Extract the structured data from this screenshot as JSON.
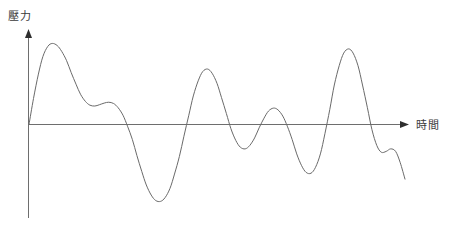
{
  "chart_data": {
    "type": "line",
    "title": "",
    "subtitle": "",
    "xlabel": "時間",
    "ylabel": "壓力",
    "grid": false,
    "legend": null,
    "axis_style": {
      "x_arrow": true,
      "y_arrow": true,
      "line_color": "#6e6e6e",
      "curve_color": "#6a6a6a",
      "background": "#ffffff"
    },
    "xlim": [
      0,
      1
    ],
    "ylim": [
      -1.1,
      1.1
    ],
    "annotations": [],
    "series": [
      {
        "name": "pressure-waveform",
        "description": "Irregular damped oscillating pressure waveform starting at the origin",
        "x": [
          0.0,
          0.012,
          0.025,
          0.037,
          0.05,
          0.062,
          0.075,
          0.087,
          0.1,
          0.112,
          0.125,
          0.137,
          0.15,
          0.162,
          0.175,
          0.187,
          0.2,
          0.212,
          0.225,
          0.237,
          0.25,
          0.262,
          0.275,
          0.287,
          0.3,
          0.312,
          0.325,
          0.337,
          0.35,
          0.362,
          0.375,
          0.387,
          0.4,
          0.412,
          0.425,
          0.437,
          0.45,
          0.462,
          0.475,
          0.487,
          0.5,
          0.512,
          0.525,
          0.537,
          0.55,
          0.562,
          0.575,
          0.587,
          0.6,
          0.612,
          0.625,
          0.637,
          0.65,
          0.662,
          0.675,
          0.687,
          0.7,
          0.712,
          0.725,
          0.737,
          0.75,
          0.762,
          0.775,
          0.787,
          0.8,
          0.812,
          0.825,
          0.837,
          0.85,
          0.862,
          0.875,
          0.887,
          0.9,
          0.912,
          0.925,
          0.937,
          0.95,
          0.962,
          0.975,
          0.987,
          1.0
        ],
        "y": [
          0.0,
          0.31,
          0.6,
          0.81,
          0.93,
          0.965,
          0.94,
          0.87,
          0.76,
          0.62,
          0.48,
          0.36,
          0.275,
          0.23,
          0.22,
          0.235,
          0.255,
          0.265,
          0.25,
          0.2,
          0.11,
          -0.02,
          -0.18,
          -0.37,
          -0.56,
          -0.72,
          -0.84,
          -0.905,
          -0.915,
          -0.87,
          -0.76,
          -0.59,
          -0.38,
          -0.14,
          0.11,
          0.34,
          0.52,
          0.63,
          0.66,
          0.61,
          0.49,
          0.32,
          0.13,
          -0.05,
          -0.19,
          -0.27,
          -0.29,
          -0.25,
          -0.16,
          -0.04,
          0.075,
          0.16,
          0.195,
          0.175,
          0.1,
          -0.02,
          -0.18,
          -0.35,
          -0.49,
          -0.57,
          -0.58,
          -0.51,
          -0.35,
          -0.11,
          0.18,
          0.47,
          0.7,
          0.85,
          0.9,
          0.85,
          0.7,
          0.47,
          0.2,
          -0.06,
          -0.25,
          -0.33,
          -0.32,
          -0.29,
          -0.32,
          -0.45,
          -0.65
        ]
      }
    ]
  }
}
